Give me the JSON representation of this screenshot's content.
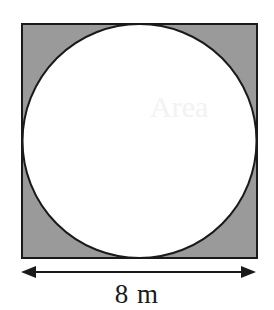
{
  "figure": {
    "colors": {
      "background": "#ffffff",
      "shaded_region": "#9a9a9a",
      "inscribed_circle_fill": "#ffffff",
      "stroke": "#1a1a1a",
      "label_text": "#1a1a1a"
    },
    "square": {
      "name": "shaded-square",
      "x": 22,
      "y": 24,
      "width": 235,
      "height": 234,
      "stroke_width": 2
    },
    "circle": {
      "name": "inscribed-circle",
      "cx": 139.5,
      "cy": 141,
      "r": 117,
      "stroke_width": 2
    },
    "dimension": {
      "name": "width-dimension",
      "label": "8 m",
      "value": 8,
      "unit": "m",
      "arrow_y": 272,
      "arrow_x1": 21,
      "arrow_x2": 256,
      "arrow_head_length": 15,
      "arrow_head_half_height": 6,
      "line_width": 2
    },
    "ghost_artifact": {
      "name": "scan-bleedthrough-artifact",
      "text": "Area"
    }
  }
}
